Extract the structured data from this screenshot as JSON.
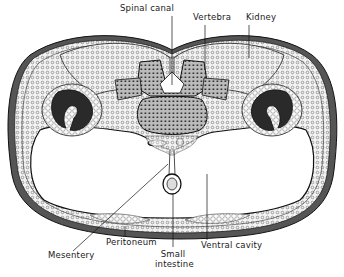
{
  "figure": {
    "labels": {
      "spinal_canal": "Spinal canal",
      "vertebra": "Vertebra",
      "kidney": "Kidney",
      "mesentery": "Mesentery",
      "peritoneum": "Peritoneum",
      "small_intestine_line1": "Small",
      "small_intestine_line2": "intestine",
      "ventral_cavity": "Ventral cavity"
    },
    "colors": {
      "ink": "#1a1a1a",
      "background": "#ffffff",
      "tissue": "#d9d9d9",
      "kidney_dark": "#222222"
    }
  }
}
